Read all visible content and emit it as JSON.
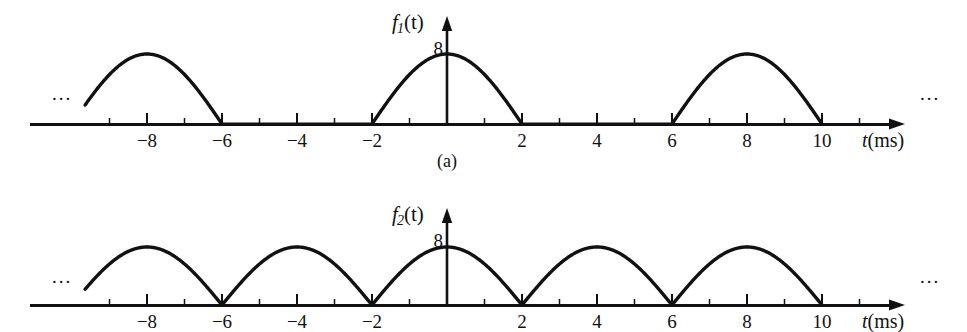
{
  "figure": {
    "background_color": "#ffffff",
    "stroke_color": "#111111",
    "panels": [
      {
        "id": "panel-a",
        "caption": "(a)",
        "function_label": {
          "base": "f",
          "subscript": "1",
          "arg": "(t)"
        },
        "amplitude_label": "8",
        "axis_label": {
          "variable": "t",
          "unit": "(ms)"
        },
        "left_ellipsis": "...",
        "right_ellipsis": "..."
      },
      {
        "id": "panel-b",
        "caption": "",
        "function_label": {
          "base": "f",
          "subscript": "2",
          "arg": "(t)"
        },
        "amplitude_label": "8",
        "axis_label": {
          "variable": "t",
          "unit": "(ms)"
        },
        "left_ellipsis": "...",
        "right_ellipsis": "..."
      }
    ]
  },
  "chart_data": [
    {
      "type": "line",
      "id": "panel-a",
      "title": "",
      "subtitle": "(a)",
      "series_name": "f1(t)",
      "xlabel": "t (ms)",
      "ylabel": "f1(t)",
      "amplitude": 8,
      "period": 8,
      "pulse_width": 4,
      "description": "Half-wave rectified sine: 8 sin(pi t / 4) on pulses centered at t = -8, 0, 8 (each spanning 4 ms), zero between pulses.",
      "xlim": [
        -11,
        11.5
      ],
      "ylim": [
        0,
        9.2
      ],
      "grid": false,
      "legend": "none",
      "xticks_major": [
        -8,
        -6,
        -4,
        -2,
        2,
        4,
        6,
        8,
        10
      ],
      "xticks_minor": [
        -9,
        -7,
        -5,
        -3,
        -1,
        1,
        3,
        5,
        7,
        9,
        11
      ],
      "yticks": [
        8
      ],
      "pulses": [
        {
          "start": -10,
          "end": -6,
          "peak_x": -8,
          "peak_y": 8,
          "truncated_left": true
        },
        {
          "start": -2,
          "end": 2,
          "peak_x": 0,
          "peak_y": 8,
          "truncated_left": false
        },
        {
          "start": 6,
          "end": 10,
          "peak_x": 8,
          "peak_y": 8,
          "truncated_left": false
        }
      ],
      "gaps": [
        [
          -6,
          -2
        ],
        [
          2,
          6
        ]
      ]
    },
    {
      "type": "line",
      "id": "panel-b",
      "title": "",
      "subtitle": "",
      "series_name": "f2(t)",
      "xlabel": "t (ms)",
      "ylabel": "f2(t)",
      "amplitude": 8,
      "period": 4,
      "pulse_width": 4,
      "description": "Full-wave rectified sine: 8 |sin(pi t / 4)| with arches on every 4 ms interval, touching zero at t = ..., -6, -2, 2, 6, 10, ...",
      "xlim": [
        -11,
        11.5
      ],
      "ylim": [
        0,
        9.2
      ],
      "grid": false,
      "legend": "none",
      "xticks_major": [
        -8,
        -6,
        -4,
        -2,
        2,
        4,
        6,
        8,
        10
      ],
      "xticks_minor": [
        -9,
        -7,
        -5,
        -3,
        -1,
        1,
        3,
        5,
        7,
        9,
        11
      ],
      "yticks": [
        8
      ],
      "pulses": [
        {
          "start": -10,
          "end": -6,
          "peak_x": -8,
          "peak_y": 8,
          "truncated_left": true
        },
        {
          "start": -6,
          "end": -2,
          "peak_x": -4,
          "peak_y": 8,
          "truncated_left": false
        },
        {
          "start": -2,
          "end": 2,
          "peak_x": 0,
          "peak_y": 8,
          "truncated_left": false
        },
        {
          "start": 2,
          "end": 6,
          "peak_x": 4,
          "peak_y": 8,
          "truncated_left": false
        },
        {
          "start": 6,
          "end": 10,
          "peak_x": 8,
          "peak_y": 8,
          "truncated_left": false
        }
      ],
      "gaps": []
    }
  ],
  "geometry": {
    "origin_x": 447,
    "px_per_unit": 37.5,
    "panel_a": {
      "baseline_y": 124,
      "amp_px": 70,
      "axis_top_y": 16,
      "left_x": 30,
      "right_x": 905
    },
    "panel_b": {
      "baseline_y": 305,
      "amp_px": 58,
      "axis_top_y": 208,
      "left_x": 30,
      "right_x": 905
    }
  }
}
